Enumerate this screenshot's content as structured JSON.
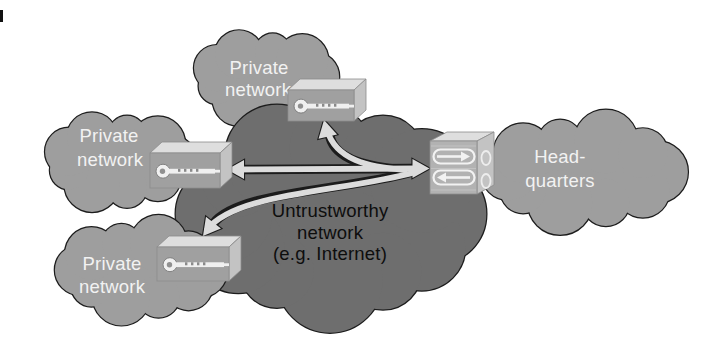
{
  "clouds": {
    "private_top": {
      "lines": [
        "Private",
        "network"
      ]
    },
    "private_middle": {
      "lines": [
        "Private",
        "network"
      ]
    },
    "private_bottom": {
      "lines": [
        "Private",
        "network"
      ]
    },
    "untrustworthy": {
      "lines": [
        "Untrustworthy",
        "network",
        "(e.g. Internet)"
      ]
    },
    "headquarters": {
      "lines": [
        "Head-",
        "quarters"
      ]
    }
  },
  "icons": {
    "vpn_gateway_icon": "key-icon",
    "headquarters_gateway_icon": "bidirectional-tunnel-arrows-icon"
  },
  "colors": {
    "background": "#ffffff",
    "cloud_light": "#9e9e9e",
    "cloud_dark": "#6e6e6e",
    "cloud_outline": "#1c1c1c",
    "label_on_light": "#f2f2f2",
    "label_on_dark": "#0d0d0d",
    "arrow_fill": "#dcdcdc",
    "arrow_outline": "#1c1c1c",
    "box_front": "#a0a0a0",
    "box_top": "#dedede",
    "box_side": "#c3c3c3",
    "hq_box_front": "#b2b2b2"
  }
}
